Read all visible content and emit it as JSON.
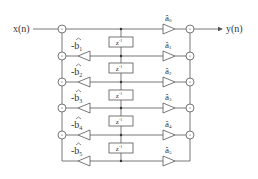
{
  "diagram": {
    "input_label": "x(n)",
    "output_label": "y(n)",
    "delay_label": "z",
    "delay_exp": "-1",
    "adder_symbol": "+",
    "feedback_coeffs": [
      {
        "prefix": "-",
        "name": "b",
        "sub": "1"
      },
      {
        "prefix": "-",
        "name": "b",
        "sub": "2"
      },
      {
        "prefix": "-",
        "name": "b",
        "sub": "3"
      },
      {
        "prefix": "-",
        "name": "b",
        "sub": "4"
      },
      {
        "prefix": "-",
        "name": "b",
        "sub": "5"
      }
    ],
    "feedforward_coeffs": [
      {
        "name": "â",
        "sub": "0"
      },
      {
        "name": "â",
        "sub": "1"
      },
      {
        "name": "â",
        "sub": "2"
      },
      {
        "name": "â",
        "sub": "3"
      },
      {
        "name": "â",
        "sub": "4"
      },
      {
        "name": "â",
        "sub": "5"
      }
    ],
    "line_color": "#555555"
  }
}
